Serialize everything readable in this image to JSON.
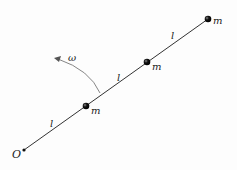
{
  "diagram": {
    "origin_label": "O",
    "masses": [
      {
        "label": "m"
      },
      {
        "label": "m"
      },
      {
        "label": "m"
      }
    ],
    "segments": [
      {
        "label": "l"
      },
      {
        "label": "l"
      },
      {
        "label": "l"
      }
    ],
    "angular_velocity_label": "ω",
    "colors": {
      "rod": "#333333",
      "mass": "#111111",
      "arc": "#777777",
      "text": "#222222"
    }
  }
}
